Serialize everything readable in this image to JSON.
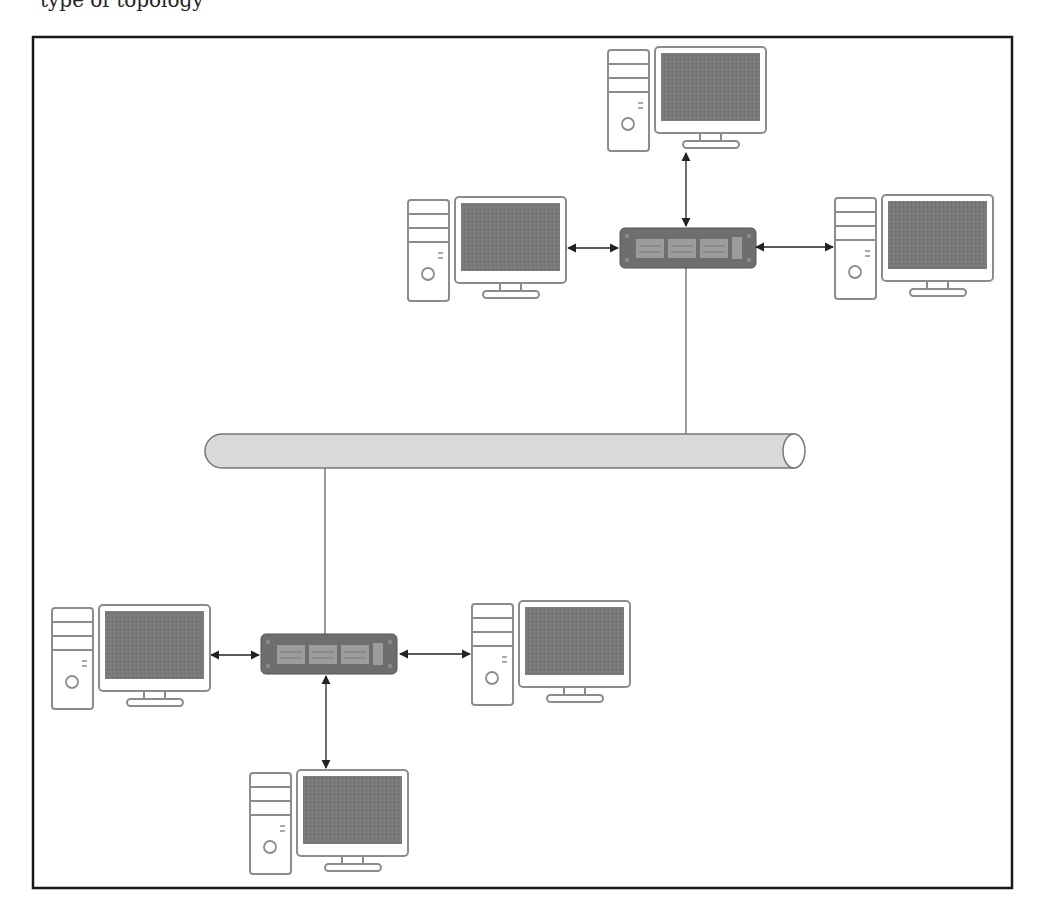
{
  "caption": "type of topology",
  "diagram": {
    "type": "bus-with-switches",
    "backbone": {
      "label": "bus-backbone",
      "x1": 205,
      "x2": 805,
      "y": 451,
      "height": 34
    },
    "switches": [
      {
        "id": "switch-top",
        "x": 620,
        "y": 228,
        "w": 134,
        "h": 40
      },
      {
        "id": "switch-bottom",
        "x": 260,
        "y": 634,
        "w": 138,
        "h": 40
      }
    ],
    "computers": [
      {
        "id": "pc-top",
        "x": 608,
        "y": 47,
        "switch": "switch-top"
      },
      {
        "id": "pc-top-left",
        "x": 408,
        "y": 197,
        "switch": "switch-top"
      },
      {
        "id": "pc-top-right",
        "x": 835,
        "y": 195,
        "switch": "switch-top"
      },
      {
        "id": "pc-bottom-left",
        "x": 52,
        "y": 605,
        "switch": "switch-bottom"
      },
      {
        "id": "pc-bottom-right",
        "x": 472,
        "y": 601,
        "switch": "switch-bottom"
      },
      {
        "id": "pc-bottom",
        "x": 250,
        "y": 770,
        "switch": "switch-bottom"
      }
    ],
    "colors": {
      "frame": "#1a1a1a",
      "screen": "#7a7a7a",
      "outline": "#8c8c8c",
      "switch_body": "#6e6e6e",
      "switch_port": "#9c9c9c",
      "pipe_fill": "#d9d9d9",
      "pipe_stroke": "#777777",
      "link": "#222222"
    }
  }
}
